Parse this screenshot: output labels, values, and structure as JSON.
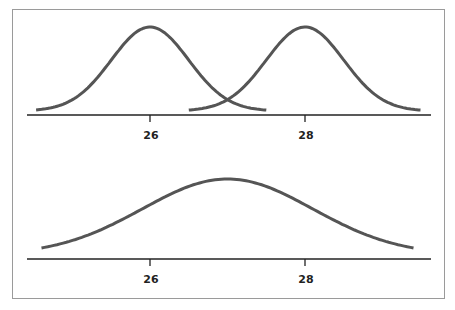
{
  "chart_data": [
    {
      "type": "line",
      "title": "",
      "description": "Two narrow normal distributions centered at 26 and 28",
      "x_ticks": [
        "26",
        "28"
      ],
      "series": [
        {
          "name": "distribution-1",
          "mean": 26,
          "sd": 0.5
        },
        {
          "name": "distribution-2",
          "mean": 28,
          "sd": 0.5
        }
      ],
      "xlabel": "",
      "ylabel": "",
      "grid": false
    },
    {
      "type": "line",
      "title": "",
      "description": "Single wide normal distribution centered at 27",
      "x_ticks": [
        "26",
        "28"
      ],
      "series": [
        {
          "name": "combined-distribution",
          "mean": 27,
          "sd": 1.1
        }
      ],
      "xlabel": "",
      "ylabel": "",
      "grid": false
    }
  ],
  "top": {
    "tick1": "26",
    "tick2": "28"
  },
  "bottom": {
    "tick1": "26",
    "tick2": "28"
  }
}
